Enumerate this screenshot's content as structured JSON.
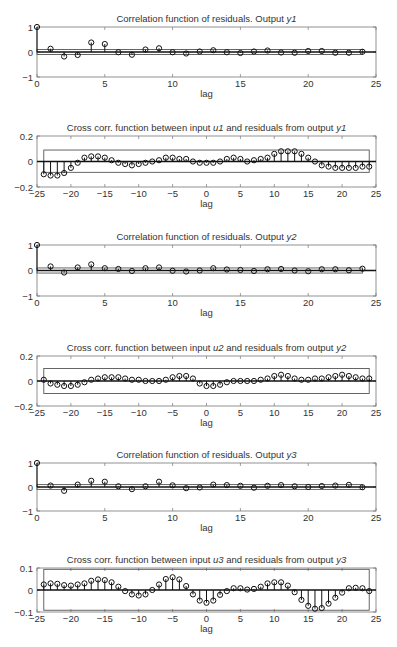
{
  "figure": {
    "width": 397,
    "height": 647
  },
  "chart_data": [
    {
      "type": "stem",
      "title": "Correlation function of residuals. Output y1",
      "title_parts": [
        "Correlation function of residuals. Output ",
        "y1"
      ],
      "xlabel": "lag",
      "ylabel": "",
      "xlim": [
        0,
        25
      ],
      "ylim": [
        -1,
        1
      ],
      "xticks": [
        0,
        5,
        10,
        15,
        20,
        25
      ],
      "yticks": [
        -1,
        0,
        1
      ],
      "confidence_band": [
        -0.1,
        0.1
      ],
      "band_x": [
        0,
        24
      ],
      "x": [
        0,
        1,
        2,
        3,
        4,
        5,
        6,
        7,
        8,
        9,
        10,
        11,
        12,
        13,
        14,
        15,
        16,
        17,
        18,
        19,
        20,
        21,
        22,
        23,
        24
      ],
      "values": [
        1.0,
        0.13,
        -0.18,
        -0.12,
        0.38,
        0.32,
        -0.01,
        -0.11,
        0.1,
        0.15,
        -0.01,
        -0.06,
        0.02,
        0.07,
        -0.01,
        -0.04,
        0.02,
        0.06,
        -0.02,
        -0.03,
        0.04,
        0.04,
        -0.03,
        -0.03,
        0.01
      ]
    },
    {
      "type": "stem",
      "title": "Cross corr. function between input u1 and residuals from output y1",
      "title_parts": [
        "Cross corr. function between input ",
        "u1",
        " and residuals from output ",
        "y1"
      ],
      "xlabel": "lag",
      "ylabel": "",
      "xlim": [
        -25,
        25
      ],
      "ylim": [
        -0.2,
        0.2
      ],
      "xticks": [
        -25,
        -20,
        -15,
        -10,
        -5,
        0,
        5,
        10,
        15,
        20,
        25
      ],
      "yticks": [
        -0.2,
        0,
        0.2
      ],
      "confidence_band": [
        -0.085,
        0.09
      ],
      "band_x": [
        -24,
        24
      ],
      "x": [
        -24,
        -23,
        -22,
        -21,
        -20,
        -19,
        -18,
        -17,
        -16,
        -15,
        -14,
        -13,
        -12,
        -11,
        -10,
        -9,
        -8,
        -7,
        -6,
        -5,
        -4,
        -3,
        -2,
        -1,
        0,
        1,
        2,
        3,
        4,
        5,
        6,
        7,
        8,
        9,
        10,
        11,
        12,
        13,
        14,
        15,
        16,
        17,
        18,
        19,
        20,
        21,
        22,
        23,
        24
      ],
      "values": [
        -0.1,
        -0.11,
        -0.11,
        -0.09,
        -0.05,
        -0.01,
        0.03,
        0.04,
        0.04,
        0.03,
        0.01,
        -0.01,
        -0.02,
        -0.03,
        -0.02,
        -0.01,
        0.0,
        0.01,
        0.03,
        0.03,
        0.02,
        0.02,
        0.0,
        -0.01,
        -0.01,
        -0.01,
        0.0,
        0.02,
        0.03,
        0.02,
        0.0,
        0.01,
        0.02,
        0.03,
        0.06,
        0.08,
        0.08,
        0.08,
        0.06,
        0.03,
        0.0,
        -0.03,
        -0.04,
        -0.05,
        -0.05,
        -0.05,
        -0.05,
        -0.04,
        -0.04
      ]
    },
    {
      "type": "stem",
      "title": "Correlation function of residuals. Output y2",
      "title_parts": [
        "Correlation function of residuals. Output ",
        "y2"
      ],
      "xlabel": "lag",
      "ylabel": "",
      "xlim": [
        0,
        25
      ],
      "ylim": [
        -1,
        1
      ],
      "xticks": [
        0,
        5,
        10,
        15,
        20,
        25
      ],
      "yticks": [
        -1,
        0,
        1
      ],
      "confidence_band": [
        -0.1,
        0.1
      ],
      "band_x": [
        0,
        24
      ],
      "x": [
        0,
        1,
        2,
        3,
        4,
        5,
        6,
        7,
        8,
        9,
        10,
        11,
        12,
        13,
        14,
        15,
        16,
        17,
        18,
        19,
        20,
        21,
        22,
        23,
        24
      ],
      "values": [
        1.0,
        0.16,
        -0.08,
        0.12,
        0.24,
        0.09,
        0.06,
        -0.02,
        0.09,
        0.12,
        -0.01,
        -0.04,
        0.0,
        0.09,
        0.04,
        0.02,
        -0.02,
        0.05,
        0.06,
        0.0,
        -0.03,
        0.05,
        0.05,
        0.01,
        0.07
      ]
    },
    {
      "type": "stem",
      "title": "Cross corr. function between input u2 and residuals from output y2",
      "title_parts": [
        "Cross corr. function between input ",
        "u2",
        " and residuals from output ",
        "y2"
      ],
      "xlabel": "lag",
      "ylabel": "",
      "xlim": [
        -25,
        25
      ],
      "ylim": [
        -0.2,
        0.2
      ],
      "xticks": [
        -25,
        -20,
        -15,
        -10,
        -5,
        0,
        5,
        10,
        15,
        20,
        25
      ],
      "yticks": [
        -0.2,
        0,
        0.2
      ],
      "confidence_band": [
        -0.1,
        0.1
      ],
      "band_x": [
        -24,
        24
      ],
      "x": [
        -24,
        -23,
        -22,
        -21,
        -20,
        -19,
        -18,
        -17,
        -16,
        -15,
        -14,
        -13,
        -12,
        -11,
        -10,
        -9,
        -8,
        -7,
        -6,
        -5,
        -4,
        -3,
        -2,
        -1,
        0,
        1,
        2,
        3,
        4,
        5,
        6,
        7,
        8,
        9,
        10,
        11,
        12,
        13,
        14,
        15,
        16,
        17,
        18,
        19,
        20,
        21,
        22,
        23,
        24
      ],
      "values": [
        0.01,
        -0.02,
        -0.03,
        -0.04,
        -0.04,
        -0.03,
        -0.01,
        0.01,
        0.02,
        0.03,
        0.03,
        0.03,
        0.02,
        0.01,
        0.01,
        0.0,
        0.0,
        0.0,
        0.01,
        0.03,
        0.04,
        0.04,
        0.02,
        -0.02,
        -0.04,
        -0.04,
        -0.03,
        -0.01,
        0.0,
        0.0,
        0.0,
        0.0,
        0.01,
        0.02,
        0.04,
        0.05,
        0.04,
        0.02,
        0.01,
        0.01,
        0.02,
        0.02,
        0.03,
        0.04,
        0.05,
        0.04,
        0.03,
        0.02,
        0.02
      ]
    },
    {
      "type": "stem",
      "title": "Correlation function of residuals. Output y3",
      "title_parts": [
        "Correlation function of residuals. Output ",
        "y3"
      ],
      "xlabel": "lag",
      "ylabel": "",
      "xlim": [
        0,
        25
      ],
      "ylim": [
        -1,
        1
      ],
      "xticks": [
        0,
        5,
        10,
        15,
        20,
        25
      ],
      "yticks": [
        -1,
        0,
        1
      ],
      "confidence_band": [
        -0.1,
        0.1
      ],
      "band_x": [
        0,
        24
      ],
      "x": [
        0,
        1,
        2,
        3,
        4,
        5,
        6,
        7,
        8,
        9,
        10,
        11,
        12,
        13,
        14,
        15,
        16,
        17,
        18,
        19,
        20,
        21,
        22,
        23,
        24
      ],
      "values": [
        1.0,
        0.06,
        -0.16,
        0.1,
        0.26,
        0.22,
        0.03,
        -0.09,
        0.03,
        0.22,
        0.07,
        -0.05,
        -0.02,
        0.1,
        0.08,
        0.05,
        -0.03,
        0.05,
        0.08,
        0.03,
        0.0,
        0.04,
        0.06,
        0.09,
        -0.01
      ]
    },
    {
      "type": "stem",
      "title": "Cross corr. function between input u3 and residuals from output y3",
      "title_parts": [
        "Cross corr. function between input ",
        "u3",
        " and residuals from output ",
        "y3"
      ],
      "xlabel": "lag",
      "ylabel": "",
      "xlim": [
        -25,
        25
      ],
      "ylim": [
        -0.1,
        0.1
      ],
      "xticks": [
        -25,
        -20,
        -15,
        -10,
        -5,
        0,
        5,
        10,
        15,
        20,
        25
      ],
      "yticks": [
        -0.1,
        0,
        0.1
      ],
      "confidence_band": [
        -0.092,
        0.094
      ],
      "band_x": [
        -24,
        24
      ],
      "x": [
        -24,
        -23,
        -22,
        -21,
        -20,
        -19,
        -18,
        -17,
        -16,
        -15,
        -14,
        -13,
        -12,
        -11,
        -10,
        -9,
        -8,
        -7,
        -6,
        -5,
        -4,
        -3,
        -2,
        -1,
        0,
        1,
        2,
        3,
        4,
        5,
        6,
        7,
        8,
        9,
        10,
        11,
        12,
        13,
        14,
        15,
        16,
        17,
        18,
        19,
        20,
        21,
        22,
        23,
        24
      ],
      "values": [
        0.025,
        0.03,
        0.028,
        0.022,
        0.02,
        0.025,
        0.03,
        0.042,
        0.048,
        0.045,
        0.035,
        0.015,
        -0.005,
        -0.02,
        -0.025,
        -0.02,
        0.0,
        0.025,
        0.05,
        0.058,
        0.048,
        0.018,
        -0.02,
        -0.048,
        -0.058,
        -0.048,
        -0.022,
        -0.005,
        0.008,
        0.008,
        0.002,
        0.005,
        0.015,
        0.03,
        0.035,
        0.035,
        0.02,
        -0.01,
        -0.045,
        -0.072,
        -0.085,
        -0.082,
        -0.062,
        -0.035,
        -0.012,
        0.008,
        0.01,
        0.008,
        -0.005
      ]
    }
  ],
  "layout": {
    "plot_left": 37,
    "plot_right": 376,
    "axes": [
      {
        "top": 27,
        "bottom": 77
      },
      {
        "top": 136,
        "bottom": 187
      },
      {
        "top": 245,
        "bottom": 296
      },
      {
        "top": 356,
        "bottom": 406
      },
      {
        "top": 463,
        "bottom": 511
      },
      {
        "top": 568,
        "bottom": 612
      }
    ]
  }
}
